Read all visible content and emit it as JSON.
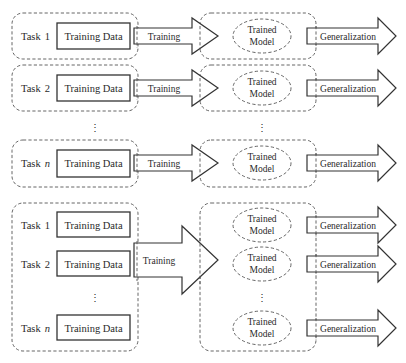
{
  "diagram": {
    "type": "flow",
    "sections": [
      {
        "name": "single-task-learning",
        "rows": [
          {
            "task_label": "Task",
            "task_index": "1",
            "data_label": "Training Data",
            "train_label": "Training",
            "model_label_line1": "Trained",
            "model_label_line2": "Model",
            "gen_label": "Generalization"
          },
          {
            "task_label": "Task",
            "task_index": "2",
            "data_label": "Training Data",
            "train_label": "Training",
            "model_label_line1": "Trained",
            "model_label_line2": "Model",
            "gen_label": "Generalization"
          },
          {
            "task_label": "Task",
            "task_index": "n",
            "data_label": "Training Data",
            "train_label": "Training",
            "model_label_line1": "Trained",
            "model_label_line2": "Model",
            "gen_label": "Generalization"
          }
        ],
        "ellipsis": "⋮"
      },
      {
        "name": "multi-task-learning",
        "tasks": [
          {
            "task_label": "Task",
            "task_index": "1",
            "data_label": "Training Data"
          },
          {
            "task_label": "Task",
            "task_index": "2",
            "data_label": "Training Data"
          },
          {
            "task_label": "Task",
            "task_index": "n",
            "data_label": "Training Data"
          }
        ],
        "train_label": "Training",
        "models": [
          {
            "line1": "Trained",
            "line2": "Model",
            "gen_label": "Generalization"
          },
          {
            "line1": "Trained",
            "line2": "Model",
            "gen_label": "Generalization"
          },
          {
            "line1": "Trained",
            "line2": "Model",
            "gen_label": "Generalization"
          }
        ],
        "ellipsis": "⋮"
      }
    ],
    "colors": {
      "stroke": "#333333",
      "dashed": "#555555",
      "text": "#2a2a2a",
      "background": "#ffffff"
    }
  }
}
